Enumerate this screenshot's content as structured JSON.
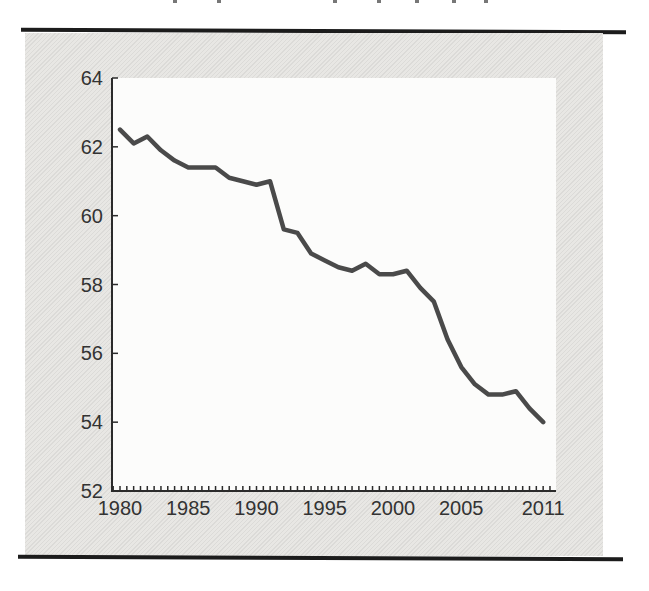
{
  "page": {
    "background_color": "#ffffff",
    "panel_color": "#e8e7e4",
    "rule_color": "#1c1c1c"
  },
  "artifacts": {
    "cropped_title_fragment_x": [
      173,
      217,
      333,
      377,
      415,
      452,
      484
    ]
  },
  "chart_data": {
    "type": "line",
    "title": "",
    "xlabel": "",
    "ylabel": "",
    "x": [
      1980,
      1981,
      1982,
      1983,
      1984,
      1985,
      1986,
      1987,
      1988,
      1989,
      1990,
      1991,
      1992,
      1993,
      1994,
      1995,
      1996,
      1997,
      1998,
      1999,
      2000,
      2001,
      2002,
      2003,
      2004,
      2005,
      2006,
      2007,
      2008,
      2009,
      2010,
      2011
    ],
    "values": [
      62.5,
      62.1,
      62.3,
      61.9,
      61.6,
      61.4,
      61.4,
      61.4,
      61.1,
      61.0,
      60.9,
      61.0,
      59.6,
      59.5,
      58.9,
      58.7,
      58.5,
      58.4,
      58.6,
      58.3,
      58.3,
      58.4,
      57.9,
      57.5,
      56.4,
      55.6,
      55.1,
      54.8,
      54.8,
      54.9,
      54.4,
      54.0
    ],
    "ylim": [
      52,
      64
    ],
    "y_ticks": [
      52,
      54,
      56,
      58,
      60,
      62,
      64
    ],
    "x_tick_labels": [
      "1980",
      "1985",
      "1990",
      "1995",
      "2000",
      "2005",
      "2011"
    ],
    "x_tick_positions": [
      1980,
      1985,
      1990,
      1995,
      2000,
      2005,
      2011
    ],
    "minor_x_tick_step_years": 0.5,
    "grid": "off",
    "legend": "none",
    "plot_background": "#fcfcfb",
    "line_color": "#4a4a4a",
    "axis_color": "#2b2b2b",
    "label_color": "#333333"
  }
}
